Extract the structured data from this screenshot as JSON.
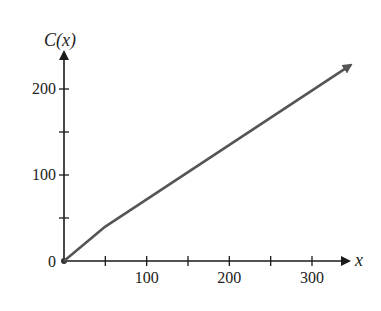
{
  "chart_data": {
    "type": "line",
    "title": "",
    "xlabel": "x",
    "ylabel": "C(x)",
    "xlim": [
      0,
      350
    ],
    "ylim": [
      0,
      240
    ],
    "x_ticks": [
      50,
      100,
      150,
      200,
      250,
      300
    ],
    "x_tick_labels": [
      "",
      "100",
      "",
      "200",
      "",
      "300"
    ],
    "y_ticks": [
      50,
      100,
      150,
      200
    ],
    "y_tick_labels": [
      "",
      "100",
      "",
      "200"
    ],
    "origin_label": "0",
    "grid": false,
    "legend": null,
    "series": [
      {
        "name": "C(x)",
        "x": [
          0,
          50,
          347
        ],
        "y": [
          0,
          40,
          228
        ],
        "color": "#555555",
        "arrow_end": true
      }
    ]
  },
  "colors": {
    "axis": "#1a1a1a",
    "curve": "#555555"
  }
}
